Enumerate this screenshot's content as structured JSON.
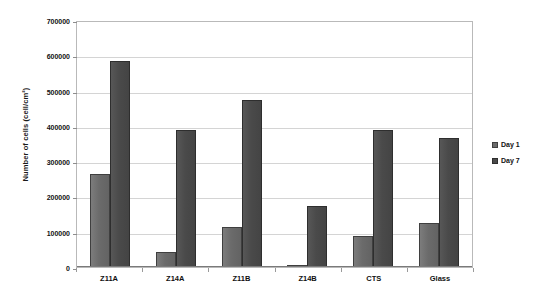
{
  "chart_data": {
    "type": "bar",
    "title": "",
    "xlabel": "",
    "ylabel": "Number of cells (cell/cm²)",
    "categories": [
      "Z11A",
      "Z14A",
      "Z11B",
      "Z14B",
      "CTS",
      "Glass"
    ],
    "series": [
      {
        "name": "Day 1",
        "color": "#6b6b6b",
        "values": [
          265000,
          42000,
          113000,
          5000,
          88000,
          125000
        ]
      },
      {
        "name": "Day 7",
        "color": "#4a4a4a",
        "values": [
          583000,
          387000,
          473000,
          172000,
          387000,
          365000
        ]
      }
    ],
    "ylim": [
      0,
      700000
    ],
    "ytick_values": [
      0,
      100000,
      200000,
      300000,
      400000,
      500000,
      600000,
      700000
    ],
    "ytick_labels": [
      "0",
      "100000",
      "200000",
      "300000",
      "400000",
      "500000",
      "600000",
      "700000"
    ],
    "grid": true,
    "legend_position": "right"
  }
}
